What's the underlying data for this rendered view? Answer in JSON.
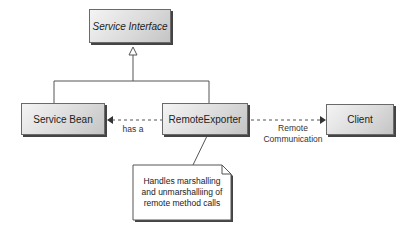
{
  "diagram": {
    "type": "uml-class-diagram",
    "nodes": {
      "service_interface": {
        "label": "Service Interface",
        "style": "italic"
      },
      "service_bean": {
        "label": "Service Bean"
      },
      "remote_exporter": {
        "label": "RemoteExporter"
      },
      "client": {
        "label": "Client"
      }
    },
    "edges": {
      "has_a": {
        "from": "RemoteExporter",
        "to": "Service Bean",
        "style": "dashed",
        "label": "has a"
      },
      "remote_comm": {
        "from": "RemoteExporter",
        "to": "Client",
        "style": "dashed",
        "label_line1": "Remote",
        "label_line2": "Communication"
      },
      "realizes": {
        "from": [
          "Service Bean",
          "RemoteExporter"
        ],
        "to": "Service Interface",
        "arrow": "hollow-triangle"
      }
    },
    "note": {
      "line1": "Handles marshalling",
      "line2": "and unmarshalliing of",
      "line3": "remote method calls"
    }
  }
}
